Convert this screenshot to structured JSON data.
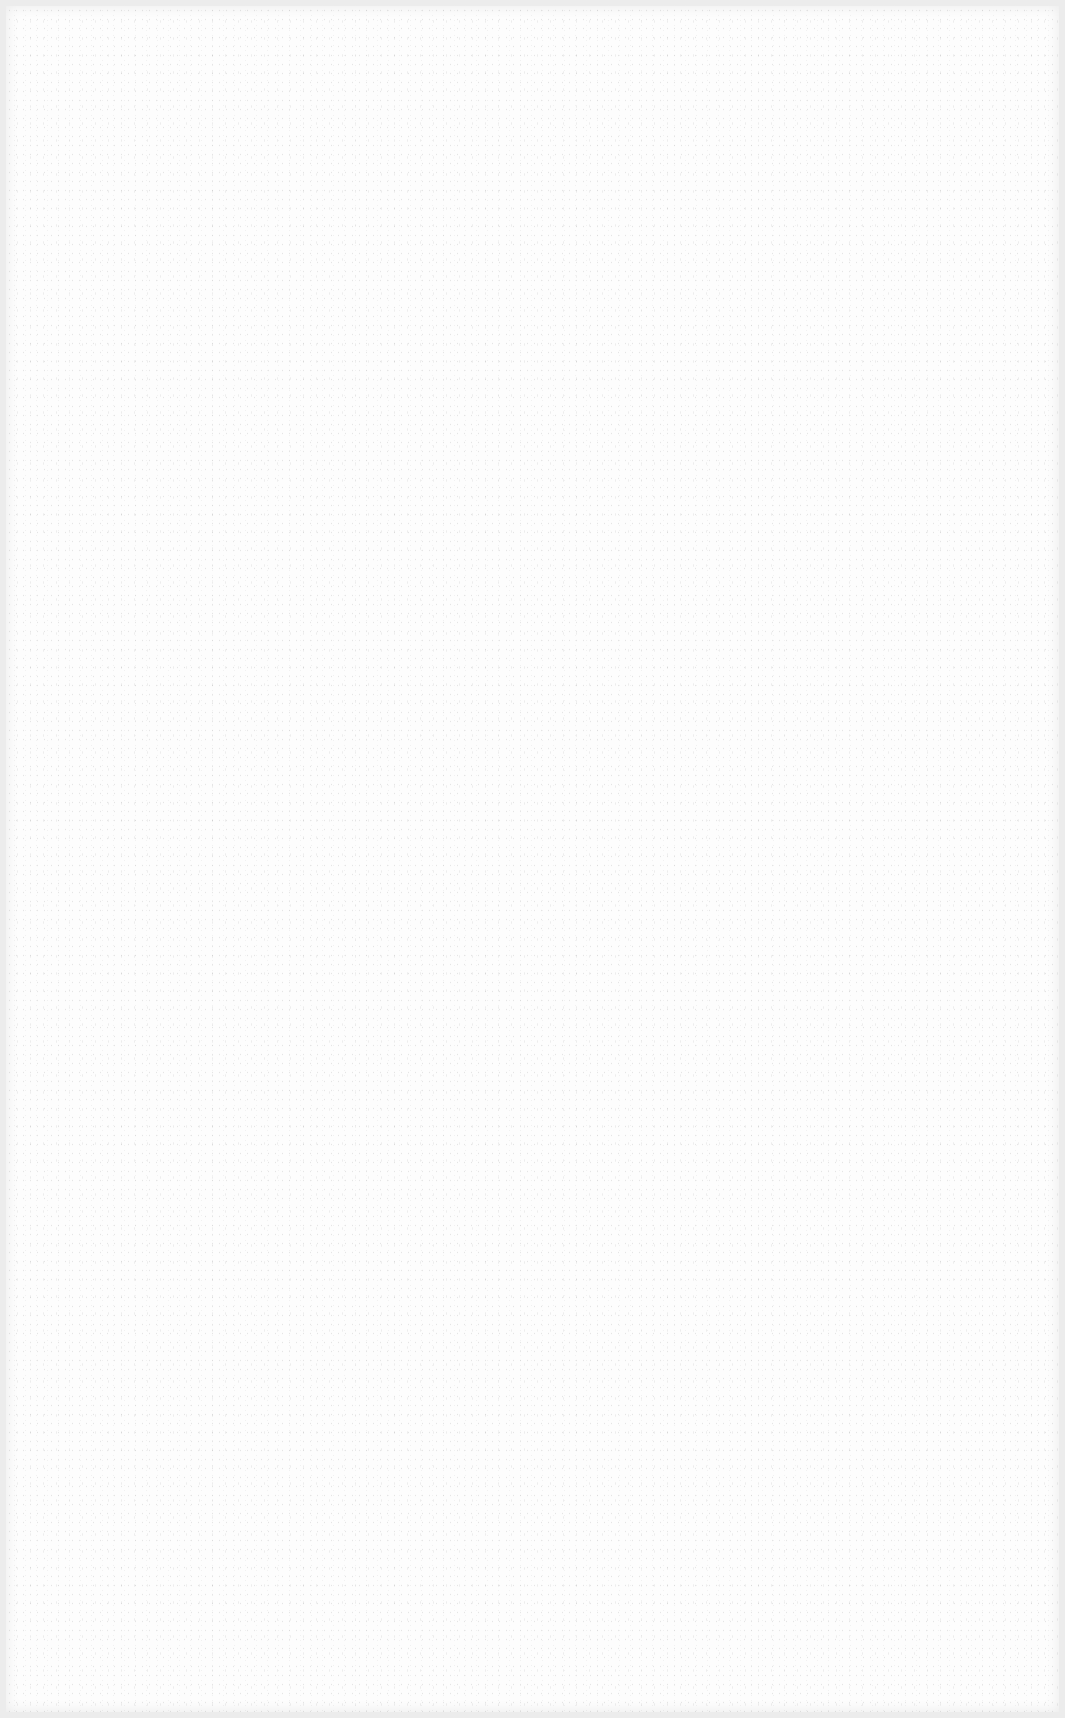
{
  "document": {
    "type": "blank scanned page",
    "text": ""
  },
  "colors": {
    "paper": "#fdfdfd",
    "border": "#ececec"
  }
}
